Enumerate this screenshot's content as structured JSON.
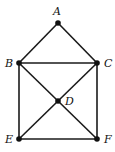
{
  "diagram": {
    "type": "graph",
    "nodes": [
      {
        "id": "A",
        "label": "A",
        "x": 58,
        "y": 23,
        "lx": 53,
        "ly": 15
      },
      {
        "id": "B",
        "label": "B",
        "x": 19,
        "y": 63,
        "lx": 5,
        "ly": 67
      },
      {
        "id": "C",
        "label": "C",
        "x": 97,
        "y": 63,
        "lx": 104,
        "ly": 67
      },
      {
        "id": "D",
        "label": "D",
        "x": 58,
        "y": 101,
        "lx": 65,
        "ly": 105
      },
      {
        "id": "E",
        "label": "E",
        "x": 19,
        "y": 139,
        "lx": 5,
        "ly": 143
      },
      {
        "id": "F",
        "label": "F",
        "x": 97,
        "y": 139,
        "lx": 104,
        "ly": 143
      }
    ],
    "edges": [
      [
        "A",
        "B"
      ],
      [
        "A",
        "C"
      ],
      [
        "B",
        "C"
      ],
      [
        "B",
        "E"
      ],
      [
        "C",
        "F"
      ],
      [
        "E",
        "F"
      ],
      [
        "B",
        "D"
      ],
      [
        "D",
        "F"
      ],
      [
        "C",
        "D"
      ],
      [
        "D",
        "E"
      ]
    ]
  }
}
